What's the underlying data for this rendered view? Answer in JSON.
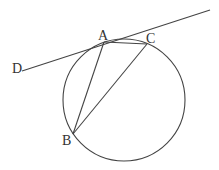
{
  "diagram": {
    "type": "geometry",
    "stroke_color": "#444444",
    "label_color": "#333333",
    "circle": {
      "cx": 124,
      "cy": 100,
      "r": 61
    },
    "points": {
      "A": {
        "label": "A",
        "x": 104,
        "y": 42,
        "label_x": 98,
        "label_y": 40
      },
      "B": {
        "label": "B",
        "x": 73,
        "y": 134,
        "label_x": 62,
        "label_y": 145
      },
      "C": {
        "label": "C",
        "x": 147,
        "y": 44,
        "label_x": 146,
        "label_y": 43
      },
      "D": {
        "label": "D",
        "x": 22,
        "y": 71,
        "label_x": 12,
        "label_y": 73
      }
    },
    "segments": [
      {
        "name": "AB",
        "from": "A",
        "to": "B"
      },
      {
        "name": "AC",
        "from": "A",
        "to": "C"
      },
      {
        "name": "BC",
        "from": "B",
        "to": "C"
      }
    ],
    "tangent_line": {
      "from": {
        "x": 22,
        "y": 71
      },
      "to": {
        "x": 210,
        "y": 10
      },
      "touches": "A"
    }
  }
}
